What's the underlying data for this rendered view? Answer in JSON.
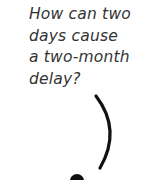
{
  "question": {
    "lines": [
      "How can two",
      "days cause",
      "a two-month",
      "delay?"
    ]
  },
  "graphic": {
    "icon": "question-mark-hook-icon",
    "stroke_color": "#111111"
  }
}
